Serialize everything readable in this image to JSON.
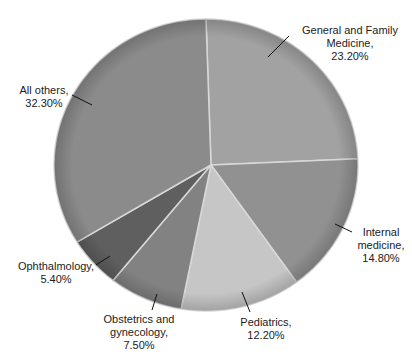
{
  "chart_data": {
    "type": "pie",
    "title": "",
    "slices": [
      {
        "label": "General and Family Medicine",
        "value": 23.2,
        "display": "23.20%",
        "color": "#a2a2a2"
      },
      {
        "label": "Internal medicine",
        "value": 14.8,
        "display": "14.80%",
        "color": "#919191"
      },
      {
        "label": "Pediatrics",
        "value": 12.2,
        "display": "12.20%",
        "color": "#c6c6c6"
      },
      {
        "label": "Obstetrics and gynecology",
        "value": 7.5,
        "display": "7.50%",
        "color": "#828282"
      },
      {
        "label": "Ophthalmology",
        "value": 5.4,
        "display": "5.40%",
        "color": "#5f5f5f"
      },
      {
        "label": "All others",
        "value": 32.3,
        "display": "32.30%",
        "color": "#8b8b8b"
      }
    ],
    "start_angle_deg": 0,
    "direction": "clockwise",
    "legend": "none",
    "labels_outside_with_leader_lines": true
  },
  "labels": {
    "gfm": {
      "line1": "General and Family",
      "line2": "Medicine,",
      "line3": "23.20%"
    },
    "im": {
      "line1": "Internal",
      "line2": "medicine,",
      "line3": "14.80%"
    },
    "ped": {
      "line1": "Pediatrics,",
      "line2": "12.20%"
    },
    "obg": {
      "line1": "Obstetrics and",
      "line2": "gynecology,",
      "line3": "7.50%"
    },
    "oph": {
      "line1": "Ophthalmology,",
      "line2": "5.40%"
    },
    "oth": {
      "line1": "All others,",
      "line2": "32.30%"
    }
  }
}
